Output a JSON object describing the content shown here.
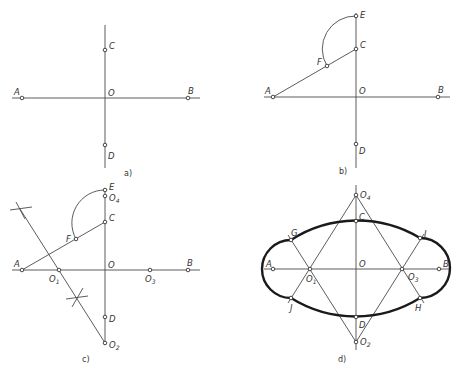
{
  "figure": {
    "panels": [
      {
        "caption": "a)",
        "points": {
          "A": "A",
          "B": "B",
          "C": "C",
          "D": "D",
          "O": "O"
        }
      },
      {
        "caption": "b)",
        "points": {
          "A": "A",
          "B": "B",
          "C": "C",
          "D": "D",
          "O": "O",
          "E": "E",
          "F": "F"
        }
      },
      {
        "caption": "c)",
        "points": {
          "A": "A",
          "B": "B",
          "C": "C",
          "D": "D",
          "O": "O",
          "E": "E",
          "F": "F",
          "O1": "O",
          "O2": "O",
          "O3": "O",
          "O4": "O"
        },
        "subscripts": {
          "O1": "1",
          "O2": "2",
          "O3": "3",
          "O4": "4"
        }
      },
      {
        "caption": "d)",
        "points": {
          "A": "A",
          "B": "B",
          "C": "C",
          "D": "D",
          "O": "O",
          "G": "G",
          "H": "H",
          "I": "I",
          "J": "J",
          "O1": "O",
          "O2": "O",
          "O3": "O",
          "O4": "O"
        },
        "subscripts": {
          "O1": "1",
          "O2": "2",
          "O3": "3",
          "O4": "4"
        }
      }
    ]
  }
}
